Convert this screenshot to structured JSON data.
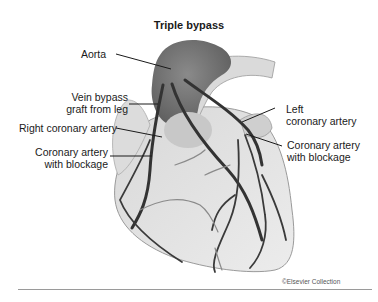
{
  "title": "Triple bypass",
  "labels": {
    "aorta": "Aorta",
    "vein_graft_line1": "Vein bypass",
    "vein_graft_line2": "graft from leg",
    "right_coronary": "Right coronary artery",
    "blockage_left_line1": "Coronary artery",
    "blockage_left_line2": "with blockage",
    "left_coronary_line1": "Left",
    "left_coronary_line2": "coronary artery",
    "blockage_right_line1": "Coronary artery",
    "blockage_right_line2": "with blockage"
  },
  "copyright": "©Elsevier Collection",
  "colors": {
    "heart_fill": "#e4e4e4",
    "aorta_fill": "#7c7c7c",
    "artery": "#3a3a3a",
    "leader": "#1a1a1a",
    "rule": "#9a9a9a"
  }
}
